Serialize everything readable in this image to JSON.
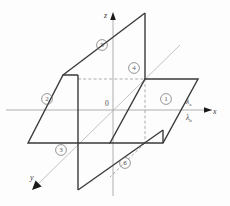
{
  "figure": {
    "background_color": "#fdfdfd",
    "axes": {
      "x": {
        "label": "x",
        "direction": "right"
      },
      "y": {
        "label": "y",
        "direction": "lower-left"
      },
      "z": {
        "label": "z",
        "direction": "up"
      },
      "origin": {
        "label": "0"
      },
      "axis_color": "#9a9a9a",
      "arrow_color": "#1a1a1a"
    },
    "annotations": [
      {
        "name": "lambda-a",
        "symbol": "λ",
        "subscript": "a",
        "position": "above-x-axis"
      },
      {
        "name": "lambda-b",
        "symbol": "λ",
        "subscript": "b",
        "position": "below-x-axis"
      }
    ],
    "regions": [
      {
        "id": "1",
        "label": "①",
        "number": "1",
        "plane": "horizontal",
        "quadrant": "right-front"
      },
      {
        "id": "2",
        "label": "②",
        "number": "2",
        "plane": "horizontal",
        "quadrant": "left-back"
      },
      {
        "id": "3",
        "label": "③",
        "number": "3",
        "plane": "horizontal",
        "quadrant": "left-front"
      },
      {
        "id": "4",
        "label": "④",
        "number": "4",
        "plane": "vertical",
        "quadrant": "upper-right"
      },
      {
        "id": "5",
        "label": "⑤",
        "number": "5",
        "plane": "vertical",
        "quadrant": "upper-left"
      },
      {
        "id": "6",
        "label": "⑥",
        "number": "6",
        "plane": "vertical",
        "quadrant": "lower-right"
      }
    ],
    "planes": {
      "horizontal": {
        "name": "horizontal-plane",
        "stroke": "#3a3a3a",
        "fill": "none",
        "description": "parallelogram lying in the xy-plane with a rectangular slot cut from its interior"
      },
      "vertical": {
        "name": "vertical-plane",
        "stroke": "#3a3a3a",
        "fill": "none",
        "description": "parallelogram standing upright, interlocking through the slot of the horizontal plane"
      }
    },
    "hidden_edges": {
      "name": "hidden-edge",
      "stroke": "#8a8a8a",
      "style": "dashed"
    }
  }
}
